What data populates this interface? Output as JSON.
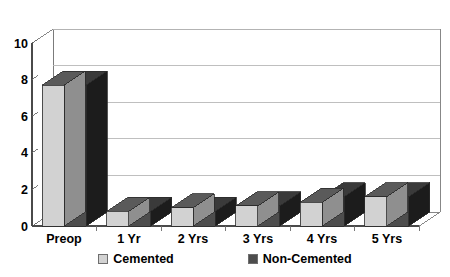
{
  "chart_data": {
    "type": "bar",
    "title": "",
    "subtitle": "",
    "xlabel": "",
    "ylabel": "",
    "categories": [
      "Preop",
      "1 Yr",
      "2 Yrs",
      "3 Yrs",
      "4 Yrs",
      "5 Yrs"
    ],
    "series": [
      {
        "name": "Cemented",
        "values": [
          7.7,
          0.8,
          1.0,
          1.1,
          1.3,
          1.6
        ]
      },
      {
        "name": "Non-Cemented",
        "values": [
          7.7,
          0.8,
          0.8,
          1.1,
          1.6,
          1.6
        ]
      }
    ],
    "ylim": [
      0,
      10
    ],
    "yticks": [
      0,
      2,
      4,
      6,
      8,
      10
    ],
    "ytick_labels": [
      "0",
      "2",
      "4",
      "6",
      "8",
      "10"
    ],
    "grid": true,
    "grid_axis": "y",
    "legend_position": "bottom",
    "three_d": true,
    "annotations": []
  },
  "legend": {
    "entries": [
      {
        "label": "Cemented",
        "color": "#d2d2d2"
      },
      {
        "label": "Non-Cemented",
        "color": "#4d4d4d"
      }
    ]
  },
  "colors": {
    "cemented_front": "#d2d2d2",
    "cemented_top": "#5a5a5a",
    "cemented_side": "#8f8f8f",
    "noncemented_front": "#4d4d4d",
    "noncemented_top": "#3a3a3a",
    "noncemented_side": "#1c1c1c",
    "grid": "#b8b8b8",
    "axis": "#4a4a4a",
    "wall": "#ffffff",
    "background": "#ffffff"
  }
}
